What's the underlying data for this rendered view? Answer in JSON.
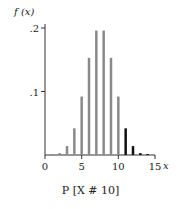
{
  "chart_data": {
    "type": "bar",
    "title": "",
    "xlabel": "x",
    "ylabel": "f(x)",
    "caption": "P [X # 10]",
    "x": [
      0,
      1,
      2,
      3,
      4,
      5,
      6,
      7,
      8,
      9,
      10,
      11,
      12,
      13,
      14,
      15
    ],
    "values": [
      0.0,
      0.0005,
      0.003,
      0.014,
      0.042,
      0.092,
      0.153,
      0.196,
      0.196,
      0.153,
      0.092,
      0.042,
      0.014,
      0.003,
      0.0005,
      0.0
    ],
    "highlight_threshold": 10,
    "colors": {
      "base": "#8a8a8a",
      "highlight": "#111111",
      "axis": "#333333"
    },
    "xlim": [
      0,
      15
    ],
    "ylim": [
      0,
      0.2
    ],
    "xticks": [
      0,
      5,
      10,
      15
    ],
    "xtick_labels": [
      "0",
      "5",
      "10",
      "15"
    ],
    "yticks": [
      0.1,
      0.2
    ],
    "ytick_labels": [
      ".1",
      ".2"
    ],
    "grid": false,
    "legend": null
  },
  "labels": {
    "ylabel": "f (x)",
    "xlabel": "x",
    "caption": "P [X # 10]"
  }
}
